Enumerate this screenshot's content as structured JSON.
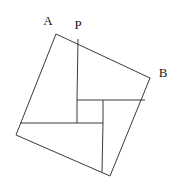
{
  "figure": {
    "name": "pinwheel-square-diagram",
    "background_color": "#ffffff",
    "stroke_color": "#3a3a3a",
    "stroke_width": 1,
    "labels": [
      {
        "id": "A",
        "text": "A",
        "x": 48,
        "y": 22
      },
      {
        "id": "P",
        "text": "P",
        "x": 78,
        "y": 26
      },
      {
        "id": "B",
        "text": "B",
        "x": 163,
        "y": 74
      }
    ],
    "points": {
      "A": {
        "x": 56,
        "y": 34
      },
      "P": {
        "x": 78,
        "y": 39
      },
      "B": {
        "x": 150,
        "y": 78
      },
      "C": {
        "x": 110,
        "y": 176
      },
      "D": {
        "x": 16,
        "y": 135
      },
      "Q": {
        "x": 145,
        "y": 100
      },
      "R": {
        "x": 102,
        "y": 172
      },
      "S": {
        "x": 20,
        "y": 123
      },
      "i1": {
        "x": 77,
        "y": 100
      },
      "i2": {
        "x": 103,
        "y": 100
      },
      "i3": {
        "x": 103,
        "y": 123
      },
      "i4": {
        "x": 77,
        "y": 123
      }
    },
    "outer_quad": "56,34 150,78 110,176 16,135",
    "inner_square": "77,100 103,100 103,123 77,123",
    "cevians": [
      {
        "name": "cevian-P-to-inner-topleft",
        "x1": 78,
        "y1": 39,
        "x2": 77,
        "y2": 100
      },
      {
        "name": "cevian-Q-to-inner-topright",
        "x1": 145,
        "y1": 100,
        "x2": 103,
        "y2": 100
      },
      {
        "name": "cevian-R-to-inner-bottomright",
        "x1": 102,
        "y1": 172,
        "x2": 103,
        "y2": 123
      },
      {
        "name": "cevian-S-to-inner-bottomleft",
        "x1": 20,
        "y1": 123,
        "x2": 77,
        "y2": 123
      }
    ]
  }
}
